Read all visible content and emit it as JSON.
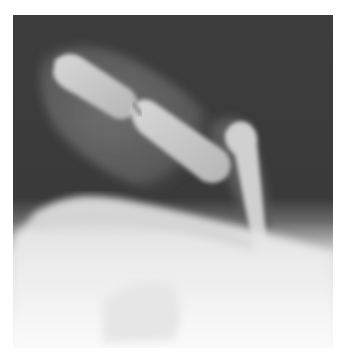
{
  "image": {
    "subject": "finger-radiograph",
    "view": "lateral",
    "colors": {
      "background": "#ffffff",
      "film_dark": "#3a3a3a",
      "soft_tissue": "#5e5e5e",
      "bone": "#c9c9c9",
      "bone_bright": "#e8e8e8",
      "overexposed": "#f6f6f6"
    }
  }
}
